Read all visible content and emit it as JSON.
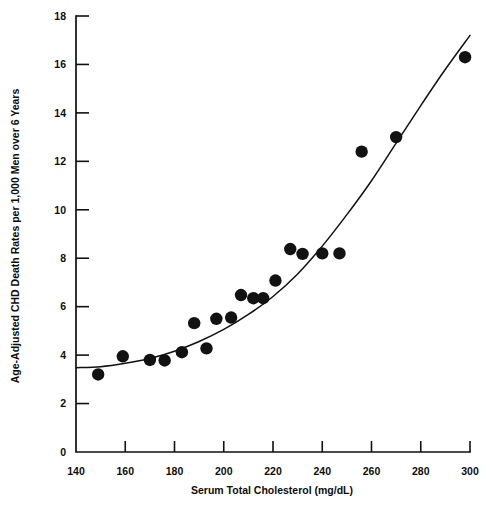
{
  "chart_data": {
    "type": "scatter",
    "title": "",
    "subtitle": "",
    "xlabel": "Serum Total Cholesterol (mg/dL)",
    "ylabel": "Age-Adjusted CHD Death Rates per 1,000 Men over 6 Years",
    "xlim": [
      140,
      300
    ],
    "ylim": [
      0,
      18
    ],
    "xticks": [
      140,
      160,
      180,
      200,
      220,
      240,
      260,
      280,
      300
    ],
    "xtick_labels": [
      "140",
      "160",
      "180",
      "200",
      "220",
      "240",
      "260",
      "280",
      "300"
    ],
    "yticks": [
      0,
      2,
      4,
      6,
      8,
      10,
      12,
      14,
      16,
      18
    ],
    "ytick_labels": [
      "0",
      "2",
      "4",
      "6",
      "8",
      "10",
      "12",
      "14",
      "16",
      "18"
    ],
    "grid": false,
    "legend": null,
    "legend_position": "none",
    "marker": {
      "shape": "circle",
      "color": "#121212",
      "radius_px": 6.2
    },
    "points": [
      {
        "x": 149,
        "y": 3.2
      },
      {
        "x": 159,
        "y": 3.95
      },
      {
        "x": 170,
        "y": 3.8
      },
      {
        "x": 176,
        "y": 3.78
      },
      {
        "x": 183,
        "y": 4.12
      },
      {
        "x": 188,
        "y": 5.32
      },
      {
        "x": 193,
        "y": 4.28
      },
      {
        "x": 197,
        "y": 5.5
      },
      {
        "x": 203,
        "y": 5.55
      },
      {
        "x": 207,
        "y": 6.48
      },
      {
        "x": 212,
        "y": 6.35
      },
      {
        "x": 216,
        "y": 6.35
      },
      {
        "x": 221,
        "y": 7.08
      },
      {
        "x": 227,
        "y": 8.38
      },
      {
        "x": 232,
        "y": 8.18
      },
      {
        "x": 240,
        "y": 8.2
      },
      {
        "x": 247,
        "y": 8.2
      },
      {
        "x": 256,
        "y": 12.4
      },
      {
        "x": 270,
        "y": 13.0
      },
      {
        "x": 298,
        "y": 16.3
      }
    ],
    "series": [
      {
        "name": "Fitted curve",
        "type": "line",
        "color": "#111111",
        "x": [
          140,
          150,
          160,
          170,
          180,
          190,
          200,
          210,
          220,
          230,
          240,
          250,
          260,
          270,
          280,
          290,
          300
        ],
        "y": [
          3.48,
          3.52,
          3.66,
          3.86,
          4.16,
          4.56,
          5.06,
          5.68,
          6.42,
          7.35,
          8.5,
          9.8,
          11.2,
          12.75,
          14.3,
          15.8,
          17.2
        ]
      }
    ],
    "annotations": []
  },
  "figure": {
    "background_color": "#ffffff",
    "axis_color": "#111111",
    "marker_color": "#121212"
  }
}
